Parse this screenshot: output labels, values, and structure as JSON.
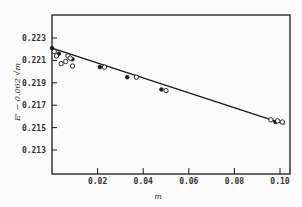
{
  "chart_data": {
    "type": "scatter",
    "title": "",
    "xlabel": "m",
    "ylabel": "E' − 0.062 √m",
    "xlim": [
      0,
      0.104
    ],
    "ylim": [
      0.211,
      0.225
    ],
    "grid": false,
    "legend": null,
    "x_ticks": [
      0.02,
      0.04,
      0.06,
      0.08,
      0.1
    ],
    "x_tick_labels": [
      "0.02",
      "0.04",
      "0.06",
      "0.08",
      "0.10"
    ],
    "y_ticks": [
      0.223,
      0.221,
      0.219,
      0.217,
      0.215,
      0.213
    ],
    "y_tick_labels": [
      "0.223",
      "0.221",
      "0.219",
      "0.217",
      "0.215",
      "0.213"
    ],
    "series": [
      {
        "name": "filled points",
        "marker": "filled-circle",
        "x": [
          0.0,
          0.003,
          0.009,
          0.021,
          0.033,
          0.048,
          0.098
        ],
        "y": [
          0.2221,
          0.2216,
          0.2211,
          0.2204,
          0.2195,
          0.2184,
          0.2155
        ]
      },
      {
        "name": "open points",
        "marker": "open-circle",
        "x": [
          0.001,
          0.002,
          0.004,
          0.006,
          0.007,
          0.008,
          0.009,
          0.023,
          0.037,
          0.05,
          0.096,
          0.099,
          0.101
        ],
        "y": [
          0.2218,
          0.2214,
          0.2207,
          0.2209,
          0.2214,
          0.2212,
          0.2205,
          0.2204,
          0.2195,
          0.2183,
          0.2157,
          0.2156,
          0.2155
        ]
      },
      {
        "name": "fit line",
        "type": "line",
        "x": [
          0.0,
          0.102
        ],
        "y": [
          0.2221,
          0.2153
        ]
      }
    ]
  },
  "colors": {
    "ink": "#1a1a1a",
    "background": "#fbfbfb"
  }
}
